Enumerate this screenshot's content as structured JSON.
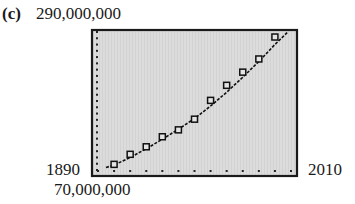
{
  "figure": {
    "panel_label": "(c)",
    "y_max_label": "290,000,000",
    "y_min_label": "70,000,000",
    "x_min_label": "1890",
    "x_max_label": "2010"
  },
  "colors": {
    "plot_background": "#dcdcdc",
    "frame": "#1a1a1a",
    "marker": "#111111",
    "curve": "#111111"
  },
  "chart_data": {
    "type": "scatter",
    "title": "",
    "xlabel": "",
    "ylabel": "",
    "xlim": [
      1890,
      2010
    ],
    "ylim": [
      70000000,
      290000000
    ],
    "x_tick_step": 10,
    "y_tick_step": 10000000,
    "grid": false,
    "legend": null,
    "series": [
      {
        "name": "data points",
        "marker": "open-square",
        "x": [
          1900,
          1910,
          1920,
          1930,
          1940,
          1950,
          1960,
          1970,
          1980,
          1990,
          2000
        ],
        "y": [
          79000000,
          95000000,
          107000000,
          123000000,
          134000000,
          151000000,
          181000000,
          205000000,
          226000000,
          247000000,
          282000000
        ]
      },
      {
        "name": "fitted curve",
        "style": "dashed-line",
        "x": [
          1895,
          1900,
          1910,
          1920,
          1930,
          1940,
          1950,
          1960,
          1970,
          1980,
          1990,
          2000,
          2008
        ],
        "y": [
          74000000,
          78000000,
          90000000,
          104000000,
          119000000,
          135000000,
          152000000,
          172000000,
          194000000,
          218000000,
          243000000,
          270000000,
          290000000
        ]
      }
    ]
  }
}
